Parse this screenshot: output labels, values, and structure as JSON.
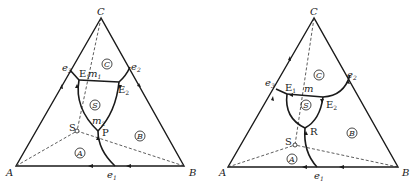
{
  "diagrams": [
    {
      "id": "left",
      "vertices": {
        "A": "A",
        "B": "B",
        "C": "C"
      },
      "binary_eutectics": {
        "e1": "e",
        "e1_sub": "1",
        "e2": "e",
        "e2_sub": "2",
        "e3": "e",
        "e3_sub": "3"
      },
      "invariant_points": {
        "E1": "E",
        "E1_sub": "1",
        "E2": "E",
        "E2_sub": "2",
        "P": "P"
      },
      "points": {
        "m1": "m",
        "m1_sub": "1",
        "m2": "m",
        "m2_sub": "2",
        "S": "S"
      },
      "fields": {
        "A": "A",
        "B": "B",
        "C": "C",
        "S": "S"
      }
    },
    {
      "id": "right",
      "vertices": {
        "A": "A",
        "B": "B",
        "C": "C"
      },
      "binary_eutectics": {
        "e1": "e",
        "e1_sub": "1",
        "e2": "e",
        "e2_sub": "2",
        "e3": "e",
        "e3_sub": "3"
      },
      "invariant_points": {
        "E1": "E",
        "E1_sub": "1",
        "E2": "E",
        "E2_sub": "2",
        "R": "R"
      },
      "points": {
        "m": "m",
        "S": "S"
      },
      "fields": {
        "A": "A",
        "B": "B",
        "C": "C",
        "S": "S"
      }
    }
  ]
}
